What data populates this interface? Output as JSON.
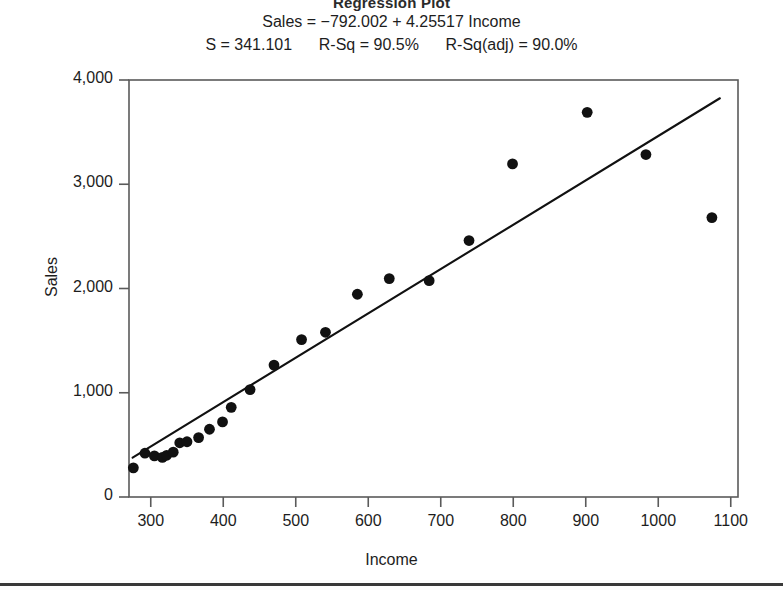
{
  "title": "Regression Plot",
  "equation_line": "Sales = −792.002 + 4.25517 Income",
  "stats_line": "S = 341.101      R-Sq = 90.5%      R-Sq(adj) = 90.0%",
  "stats": {
    "s": "341.101",
    "r_sq": "90.5%",
    "r_sq_adj": "90.0%",
    "intercept": "-792.002",
    "slope": "4.25517"
  },
  "chart_data": {
    "type": "scatter",
    "title": "Regression Plot",
    "xlabel": "Income",
    "ylabel": "Sales",
    "xlim": [
      270,
      1110
    ],
    "ylim": [
      0,
      4000
    ],
    "xticks": [
      300,
      400,
      500,
      600,
      700,
      800,
      900,
      1000,
      1100
    ],
    "xticklabels": [
      "300",
      "400",
      "500",
      "600",
      "700",
      "800",
      "900",
      "1000",
      "1100"
    ],
    "yticks": [
      0,
      1000,
      2000,
      3000,
      4000
    ],
    "yticklabels": [
      "0",
      "1,000",
      "2,000",
      "3,000",
      "4,000"
    ],
    "grid": false,
    "legend": null,
    "series": [
      {
        "name": "Sales vs Income",
        "marker": "filled-circle",
        "color": "#111111",
        "points": [
          {
            "x": 276,
            "y": 280
          },
          {
            "x": 292,
            "y": 420
          },
          {
            "x": 305,
            "y": 395
          },
          {
            "x": 316,
            "y": 380
          },
          {
            "x": 322,
            "y": 400
          },
          {
            "x": 331,
            "y": 430
          },
          {
            "x": 340,
            "y": 520
          },
          {
            "x": 350,
            "y": 530
          },
          {
            "x": 366,
            "y": 570
          },
          {
            "x": 381,
            "y": 650
          },
          {
            "x": 399,
            "y": 720
          },
          {
            "x": 411,
            "y": 860
          },
          {
            "x": 437,
            "y": 1030
          },
          {
            "x": 470,
            "y": 1265
          },
          {
            "x": 508,
            "y": 1510
          },
          {
            "x": 541,
            "y": 1580
          },
          {
            "x": 585,
            "y": 1945
          },
          {
            "x": 629,
            "y": 2095
          },
          {
            "x": 684,
            "y": 2075
          },
          {
            "x": 739,
            "y": 2460
          },
          {
            "x": 799,
            "y": 3195
          },
          {
            "x": 902,
            "y": 3690
          },
          {
            "x": 983,
            "y": 3285
          },
          {
            "x": 1074,
            "y": 2680
          }
        ]
      }
    ],
    "fit_line": {
      "name": "least-squares fit",
      "color": "#111111",
      "x_start": 275,
      "x_end": 1085,
      "y_start": 378,
      "y_end": 3825
    }
  }
}
